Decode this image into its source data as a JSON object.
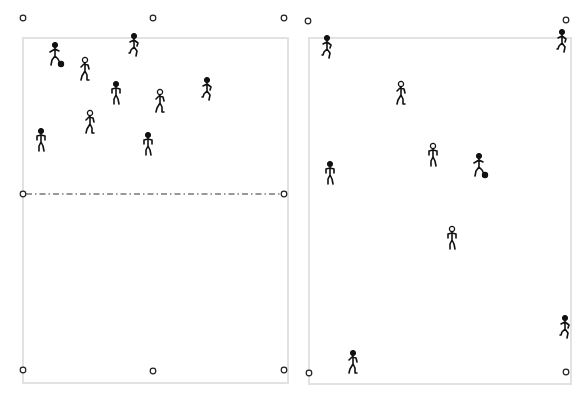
{
  "diagram": {
    "colors": {
      "pitch_border": "#e2e2e2",
      "figure": "#111111",
      "cone_outline": "#222222",
      "background": "#ffffff"
    },
    "pitches": [
      {
        "id": "left-pitch",
        "border": {
          "x": 23,
          "y": 38,
          "w": 265,
          "h": 345
        },
        "halfway_line": {
          "x1": 26,
          "x2": 282,
          "y": 194,
          "style": "dash-dot"
        },
        "cones": [
          {
            "x": 23,
            "y": 18
          },
          {
            "x": 153,
            "y": 18
          },
          {
            "x": 284,
            "y": 18
          },
          {
            "x": 23,
            "y": 194
          },
          {
            "x": 284,
            "y": 194
          },
          {
            "x": 23,
            "y": 370
          },
          {
            "x": 153,
            "y": 371
          },
          {
            "x": 284,
            "y": 370
          }
        ],
        "players": [
          {
            "x": 55,
            "y": 55,
            "head": "filled",
            "pose": "dribble",
            "has_ball": true
          },
          {
            "x": 85,
            "y": 70,
            "head": "open",
            "pose": "walk"
          },
          {
            "x": 134,
            "y": 46,
            "head": "filled",
            "pose": "run"
          },
          {
            "x": 116,
            "y": 94,
            "head": "filled",
            "pose": "stand"
          },
          {
            "x": 160,
            "y": 102,
            "head": "open",
            "pose": "walk"
          },
          {
            "x": 207,
            "y": 90,
            "head": "filled",
            "pose": "run"
          },
          {
            "x": 90,
            "y": 123,
            "head": "open",
            "pose": "walk"
          },
          {
            "x": 41,
            "y": 141,
            "head": "filled",
            "pose": "stand"
          },
          {
            "x": 148,
            "y": 145,
            "head": "filled",
            "pose": "stand"
          }
        ]
      },
      {
        "id": "right-pitch",
        "border": {
          "x": 309,
          "y": 38,
          "w": 262,
          "h": 346
        },
        "cones": [
          {
            "x": 308,
            "y": 21
          },
          {
            "x": 566,
            "y": 20
          },
          {
            "x": 309,
            "y": 373
          },
          {
            "x": 566,
            "y": 372
          }
        ],
        "players": [
          {
            "x": 327,
            "y": 48,
            "head": "filled",
            "pose": "run"
          },
          {
            "x": 562,
            "y": 42,
            "head": "filled",
            "pose": "run"
          },
          {
            "x": 401,
            "y": 94,
            "head": "open",
            "pose": "walk"
          },
          {
            "x": 433,
            "y": 156,
            "head": "open",
            "pose": "stand"
          },
          {
            "x": 479,
            "y": 166,
            "head": "filled",
            "pose": "dribble",
            "has_ball": true
          },
          {
            "x": 330,
            "y": 174,
            "head": "filled",
            "pose": "stand"
          },
          {
            "x": 452,
            "y": 239,
            "head": "open",
            "pose": "stand"
          },
          {
            "x": 565,
            "y": 328,
            "head": "filled",
            "pose": "run"
          },
          {
            "x": 353,
            "y": 363,
            "head": "filled",
            "pose": "walk"
          }
        ]
      }
    ]
  }
}
